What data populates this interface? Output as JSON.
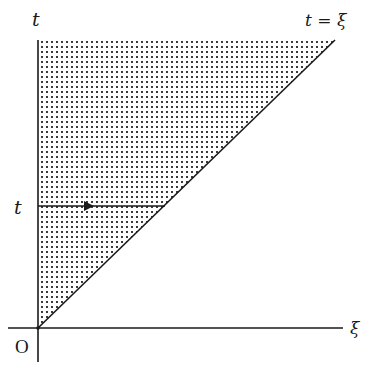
{
  "diagram": {
    "type": "region-of-integration",
    "labels": {
      "vertical_axis": "t",
      "horizontal_axis": "ξ",
      "origin": "O",
      "diagonal": "t = ξ",
      "horizontal_line": "t"
    },
    "colors": {
      "stroke": "#1a1a1a",
      "dot": "#3a3a3a",
      "background": "#ffffff"
    },
    "geometry": {
      "origin": [
        38,
        328
      ],
      "region_top_y": 40,
      "diagonal_end": [
        335,
        40
      ],
      "horizontal_line_y": 206,
      "horizontal_line_end_x": 165,
      "arrow_x": 88,
      "x_axis_extent": [
        8,
        343
      ],
      "y_axis_extent": [
        40,
        362
      ]
    }
  }
}
